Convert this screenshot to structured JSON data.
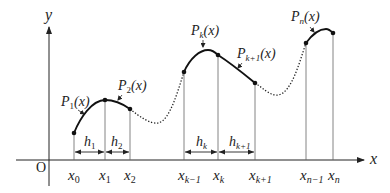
{
  "axes": {
    "y_label": "y",
    "x_label": "x",
    "origin_label": "O"
  },
  "nodes": [
    {
      "label_main": "x",
      "label_sub": "0",
      "px": 74,
      "py": 133
    },
    {
      "label_main": "x",
      "label_sub": "1",
      "px": 105,
      "py": 100
    },
    {
      "label_main": "x",
      "label_sub": "2",
      "px": 130,
      "py": 109
    },
    {
      "label_main": "x",
      "label_sub": "k−1",
      "px": 184,
      "py": 72
    },
    {
      "label_main": "x",
      "label_sub": "k",
      "px": 218,
      "py": 55
    },
    {
      "label_main": "x",
      "label_sub": "k+1",
      "px": 255,
      "py": 83
    },
    {
      "label_main": "x",
      "label_sub": "n−1",
      "px": 306,
      "py": 43
    },
    {
      "label_main": "x",
      "label_sub": "n",
      "px": 333,
      "py": 33
    }
  ],
  "intervals": [
    {
      "main": "h",
      "sub": "1"
    },
    {
      "main": "h",
      "sub": "2"
    },
    {
      "main": "h",
      "sub": "k"
    },
    {
      "main": "h",
      "sub": "k+1"
    }
  ],
  "polynomials": [
    {
      "main": "P",
      "sub": "1",
      "arg": "(x)"
    },
    {
      "main": "P",
      "sub": "2",
      "arg": "(x)"
    },
    {
      "main": "P",
      "sub": "k",
      "arg": "(x)"
    },
    {
      "main": "P",
      "sub": "k+1",
      "arg": "(x)"
    },
    {
      "main": "P",
      "sub": "n",
      "arg": "(x)"
    }
  ],
  "colors": {
    "curve": "#111111",
    "axis": "#222222",
    "guide": "#555555"
  }
}
